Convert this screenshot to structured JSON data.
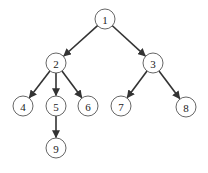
{
  "diagram": {
    "type": "tree",
    "directed": true,
    "node_radius": 10,
    "colors": {
      "edge": "#333333",
      "node_stroke": "#555555",
      "node_fill": "#ffffff",
      "label": "#222222",
      "background": "#ffffff"
    },
    "nodes": [
      {
        "id": "1",
        "label": "1",
        "x": 105,
        "y": 19
      },
      {
        "id": "2",
        "label": "2",
        "x": 56,
        "y": 63
      },
      {
        "id": "3",
        "label": "3",
        "x": 153,
        "y": 63
      },
      {
        "id": "4",
        "label": "4",
        "x": 23,
        "y": 106
      },
      {
        "id": "5",
        "label": "5",
        "x": 56,
        "y": 106
      },
      {
        "id": "6",
        "label": "6",
        "x": 88,
        "y": 106
      },
      {
        "id": "7",
        "label": "7",
        "x": 121,
        "y": 106
      },
      {
        "id": "8",
        "label": "8",
        "x": 186,
        "y": 107
      },
      {
        "id": "9",
        "label": "9",
        "x": 56,
        "y": 148
      }
    ],
    "edges": [
      {
        "from": "1",
        "to": "2"
      },
      {
        "from": "1",
        "to": "3"
      },
      {
        "from": "2",
        "to": "4"
      },
      {
        "from": "2",
        "to": "5"
      },
      {
        "from": "2",
        "to": "6"
      },
      {
        "from": "3",
        "to": "7"
      },
      {
        "from": "3",
        "to": "8"
      },
      {
        "from": "5",
        "to": "9"
      }
    ]
  }
}
